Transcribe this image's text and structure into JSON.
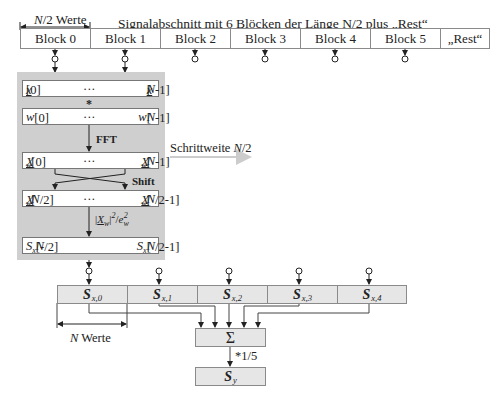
{
  "header": {
    "half_n_label": "N/2 Werte",
    "title": "Signalabschnitt mit 6 Blöcken der Länge N/2 plus „Rest“"
  },
  "blocks": [
    {
      "label": "Block 0"
    },
    {
      "label": "Block 1"
    },
    {
      "label": "Block 2"
    },
    {
      "label": "Block 3"
    },
    {
      "label": "Block 4"
    },
    {
      "label": "Block 5"
    },
    {
      "label": "„Rest“"
    }
  ],
  "processing": {
    "rows": [
      {
        "left": "x[0]",
        "mid": "···",
        "right": "x[N-1]"
      },
      {
        "left": "w[0]",
        "mid": "···",
        "right": "w[N-1]"
      },
      {
        "left": "X_w[0]",
        "mid": "···",
        "right": "X_w[N-1]"
      },
      {
        "left": "X_w[N/2]",
        "mid": "···",
        "right": "X_w[N/2-1]"
      },
      {
        "left": "S_x[-N/2]",
        "mid": "",
        "right": "S_x[N/2-1]"
      }
    ],
    "multiply_label": "*",
    "fft_label": "FFT",
    "shift_label": "Shift",
    "norm_label": "|X_w|²/e_w²"
  },
  "step_label": "Schrittweite N/2",
  "spectra": [
    {
      "label": "S",
      "sub": "x,0"
    },
    {
      "label": "S",
      "sub": "x,1"
    },
    {
      "label": "S",
      "sub": "x,2"
    },
    {
      "label": "S",
      "sub": "x,3"
    },
    {
      "label": "S",
      "sub": "x,4"
    }
  ],
  "n_values_label": "N Werte",
  "sum_label": "Σ",
  "scale_label": "*1/5",
  "result": {
    "label": "S",
    "sub": "y"
  },
  "colors": {
    "box_gray": "#cfcfcf",
    "spectrum_fill": "#e6e6e6",
    "line": "#444444",
    "step_arrow": "#cccccc"
  }
}
